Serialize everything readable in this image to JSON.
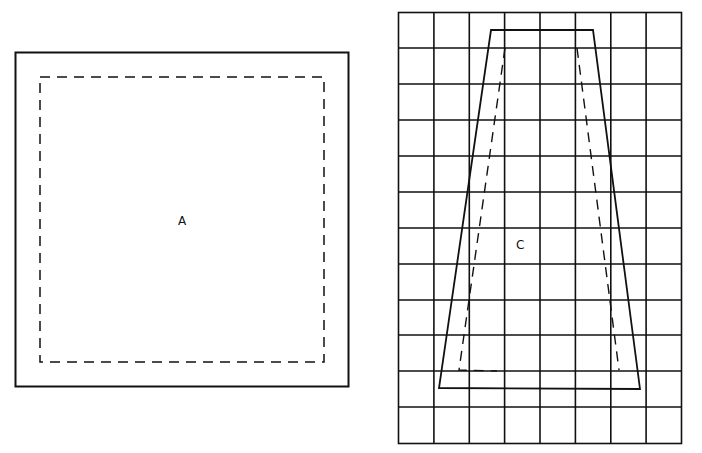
{
  "figure": {
    "panels": [
      {
        "id": "A",
        "label": "A",
        "shape": "square",
        "outline": "solid",
        "inner_outline": "dashed"
      },
      {
        "id": "C",
        "label": "C",
        "shape": "trapezoid",
        "outline": "solid",
        "inner_outline": "dashed",
        "background": "grid",
        "grid": {
          "columns": 8,
          "rows": 12
        }
      }
    ],
    "colors": {
      "line": "#111111",
      "background": "#ffffff"
    }
  }
}
